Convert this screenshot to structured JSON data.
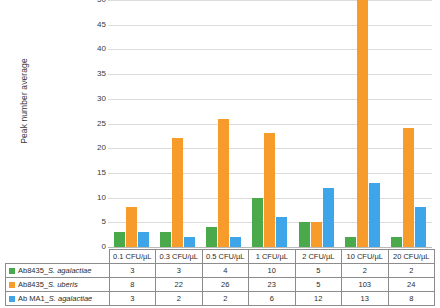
{
  "chart_data": {
    "type": "bar",
    "title": "",
    "xlabel": "",
    "ylabel": "Peak number average",
    "ylim": [
      0,
      50
    ],
    "ytick_step": 5,
    "yticks": [
      50,
      45,
      40,
      35,
      30,
      25,
      20,
      15,
      10,
      5,
      0
    ],
    "grid": true,
    "legend_position": "data-table-below",
    "categories": [
      "0.1 CFU/µL",
      "0.3 CFU/µL",
      "0.5 CFU/µL",
      "1 CFU/µL",
      "2 CFU/µL",
      "10 CFU/µL",
      "20 CFU/µL"
    ],
    "series": [
      {
        "name": "Ab8435_S. agalactiae",
        "name_prefix": "Ab8435_",
        "name_species": "S. agalactiae",
        "color": "#4aa94a",
        "values": [
          3,
          3,
          4,
          10,
          5,
          2,
          2
        ]
      },
      {
        "name": "Ab8435_S. uberis",
        "name_prefix": "Ab8435_",
        "name_species": "S. uberis",
        "color": "#f79c2b",
        "values": [
          8,
          22,
          26,
          23,
          5,
          103,
          24
        ]
      },
      {
        "name": "Ab MA1_S. agalactiae",
        "name_prefix": "Ab MA1_",
        "name_species": "S. agalactiae",
        "color": "#3ea6e8",
        "values": [
          3,
          2,
          2,
          6,
          12,
          13,
          8
        ]
      }
    ]
  },
  "colors": {
    "series_green": "#4aa94a",
    "series_orange": "#f79c2b",
    "series_blue": "#3ea6e8",
    "gridline": "#dcdcdc",
    "axis": "#b9b9b9",
    "table_border": "#8c8c8c",
    "background": "#ffffff"
  }
}
